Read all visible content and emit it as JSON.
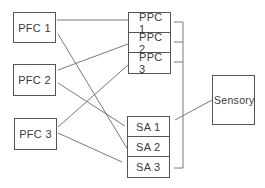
{
  "diagram": {
    "pfc": [
      {
        "label": "PFC 1"
      },
      {
        "label": "PFC 2"
      },
      {
        "label": "PFC 3"
      }
    ],
    "ppc": [
      {
        "label": "PPC 1"
      },
      {
        "label": "PPC 2"
      },
      {
        "label": "PPC 3"
      }
    ],
    "sa": [
      {
        "label": "SA 1"
      },
      {
        "label": "SA 2"
      },
      {
        "label": "SA 3"
      }
    ],
    "sensory": {
      "label": "Sensory"
    },
    "connections": [
      {
        "from": "PFC 1",
        "to": "PPC 1"
      },
      {
        "from": "PFC 1",
        "to": "SA 2"
      },
      {
        "from": "PFC 2",
        "to": "PPC 2"
      },
      {
        "from": "PFC 2",
        "to": "SA 1"
      },
      {
        "from": "PFC 3",
        "to": "PPC 3"
      },
      {
        "from": "PFC 3",
        "to": "SA 3"
      },
      {
        "from": "Sensory",
        "to": "SA 1"
      },
      {
        "from": "SA 1",
        "to": "SA 3",
        "note": "internal vertical link"
      },
      {
        "from": "PPC 1-3",
        "to": "SA 1-3",
        "note": "bracket bus on right side"
      }
    ],
    "line_color": "#666666"
  }
}
